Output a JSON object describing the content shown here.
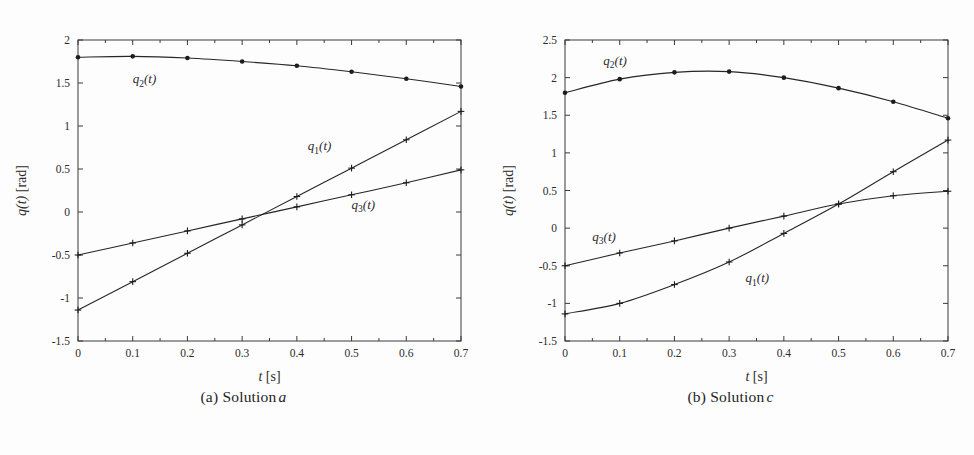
{
  "figure": {
    "background_color": "#fdfdfd",
    "line_color": "#262626",
    "axis_color": "#3a3a3a",
    "panels": [
      {
        "id": "panel-a",
        "caption_prefix": "(a) Solution",
        "caption_italic": "a"
      },
      {
        "id": "panel-b",
        "caption_prefix": "(b) Solution",
        "caption_italic": "c"
      }
    ]
  },
  "chart_data": [
    {
      "type": "line",
      "title": "Solution a",
      "panel_label": "(a) Solution a",
      "xlabel": "t [s]",
      "ylabel": "q(t) [rad]",
      "xlim": [
        0,
        0.7
      ],
      "ylim": [
        -1.5,
        2
      ],
      "xticks": [
        0,
        0.1,
        0.2,
        0.3,
        0.4,
        0.5,
        0.6,
        0.7
      ],
      "xticklabels": [
        "0",
        "0.1",
        "0.2",
        "0.3",
        "0.4",
        "0.5",
        "0.6",
        "0.7"
      ],
      "yticks": [
        -1.5,
        -1,
        -0.5,
        0,
        0.5,
        1,
        1.5,
        2
      ],
      "yticklabels": [
        "-1.5",
        "-1",
        "-0.5",
        "0",
        "0.5",
        "1",
        "1.5",
        "2"
      ],
      "grid": false,
      "legend": "inline-annotations",
      "x": [
        0,
        0.1,
        0.2,
        0.3,
        0.4,
        0.5,
        0.6,
        0.7
      ],
      "series": [
        {
          "name": "q1(t)",
          "marker": "plus",
          "label_text": "q1(t)",
          "label_x": 0.42,
          "label_y": 0.72,
          "values": [
            -1.14,
            -0.81,
            -0.48,
            -0.15,
            0.18,
            0.51,
            0.84,
            1.17
          ]
        },
        {
          "name": "q2(t)",
          "marker": "dot",
          "label_text": "q2(t)",
          "label_x": 0.1,
          "label_y": 1.5,
          "values": [
            1.8,
            1.81,
            1.79,
            1.75,
            1.7,
            1.63,
            1.55,
            1.46
          ]
        },
        {
          "name": "q3(t)",
          "marker": "plus",
          "label_text": "q3(t)",
          "label_x": 0.5,
          "label_y": 0.04,
          "values": [
            -0.5,
            -0.36,
            -0.22,
            -0.08,
            0.06,
            0.2,
            0.34,
            0.49
          ]
        }
      ]
    },
    {
      "type": "line",
      "title": "Solution c",
      "panel_label": "(b) Solution c",
      "xlabel": "t [s]",
      "ylabel": "q(t) [rad]",
      "xlim": [
        0,
        0.7
      ],
      "ylim": [
        -1.5,
        2.5
      ],
      "xticks": [
        0,
        0.1,
        0.2,
        0.3,
        0.4,
        0.5,
        0.6,
        0.7
      ],
      "xticklabels": [
        "0",
        "0.1",
        "0.2",
        "0.3",
        "0.4",
        "0.5",
        "0.6",
        "0.7"
      ],
      "yticks": [
        -1.5,
        -1,
        -0.5,
        0,
        0.5,
        1,
        1.5,
        2,
        2.5
      ],
      "yticklabels": [
        "-1.5",
        "-1",
        "-0.5",
        "0",
        "0.5",
        "1",
        "1.5",
        "2",
        "2.5"
      ],
      "grid": false,
      "legend": "inline-annotations",
      "x": [
        0,
        0.1,
        0.2,
        0.3,
        0.4,
        0.5,
        0.6,
        0.7
      ],
      "series": [
        {
          "name": "q1(t)",
          "marker": "plus",
          "label_text": "q1(t)",
          "label_x": 0.33,
          "label_y": -0.72,
          "values": [
            -1.14,
            -1.0,
            -0.75,
            -0.45,
            -0.07,
            0.32,
            0.75,
            1.17
          ]
        },
        {
          "name": "q2(t)",
          "marker": "dot",
          "label_text": "q2(t)",
          "label_x": 0.07,
          "label_y": 2.17,
          "values": [
            1.8,
            1.98,
            2.07,
            2.08,
            2.0,
            1.86,
            1.68,
            1.46
          ]
        },
        {
          "name": "q3(t)",
          "marker": "plus",
          "label_text": "q3(t)",
          "label_x": 0.05,
          "label_y": -0.17,
          "values": [
            -0.5,
            -0.33,
            -0.17,
            0.0,
            0.16,
            0.32,
            0.43,
            0.49
          ]
        }
      ]
    }
  ]
}
